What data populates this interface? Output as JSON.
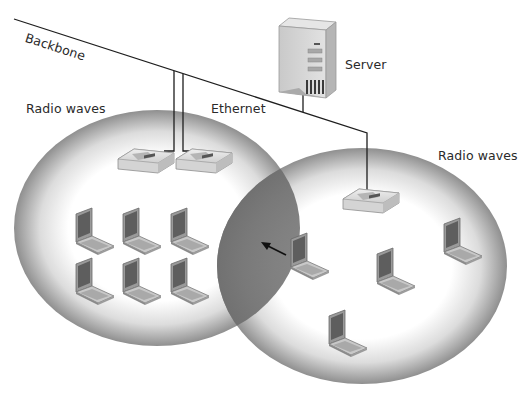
{
  "diagram": {
    "type": "network-topology",
    "title": "",
    "labels": {
      "backbone": "Backbone",
      "radio_waves_left": "Radio waves",
      "ethernet": "Ethernet",
      "server": "Server",
      "radio_waves_right": "Radio waves"
    },
    "nodes": {
      "server": {
        "label": "Server",
        "icon": "server-tower-icon"
      },
      "access_points": [
        {
          "id": "ap-left-1",
          "icon": "wireless-access-point-icon",
          "cell": "left"
        },
        {
          "id": "ap-left-2",
          "icon": "wireless-access-point-icon",
          "cell": "left"
        },
        {
          "id": "ap-right-1",
          "icon": "wireless-access-point-icon",
          "cell": "right"
        }
      ],
      "laptops_left_cell": 6,
      "laptops_right_cell": 4
    },
    "links": [
      {
        "from": "backbone",
        "to": "server",
        "medium": "Ethernet"
      },
      {
        "from": "backbone",
        "to": "ap-left-1",
        "medium": "Ethernet"
      },
      {
        "from": "backbone",
        "to": "ap-left-2",
        "medium": "Ethernet"
      },
      {
        "from": "backbone",
        "to": "ap-right-1",
        "medium": "Ethernet"
      }
    ],
    "coverage_cells": [
      {
        "id": "left-cell",
        "label": "Radio waves"
      },
      {
        "id": "right-cell",
        "label": "Radio waves"
      }
    ],
    "roaming_arrow": {
      "from": "right-cell laptop",
      "toward": "overlap region"
    },
    "colors": {
      "line": "#1e1e1e",
      "cell_edge": "#8c8c8c",
      "cell_center": "#ffffff",
      "overlap": "#7a7a7a",
      "device_body": "#cfcfcf",
      "screen": "#5a5a5a"
    }
  }
}
